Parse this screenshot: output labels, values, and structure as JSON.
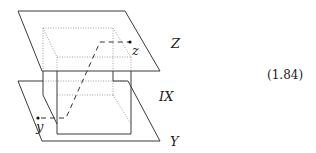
{
  "diagram": {
    "labels": {
      "top_plane": "Z",
      "middle": "IX",
      "bottom_plane": "Y",
      "top_point": "z",
      "bottom_point": "y"
    },
    "equation_number": "(1.84)"
  }
}
